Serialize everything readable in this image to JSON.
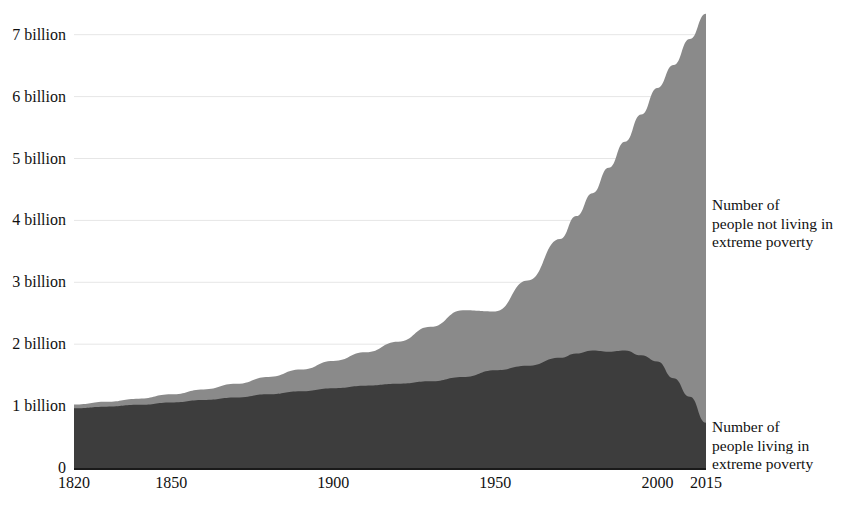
{
  "figure": {
    "background_color": "#ffffff"
  },
  "axes": {
    "y_ticks": [
      {
        "label": "0",
        "value": 0
      },
      {
        "label": "1 billion",
        "value": 1
      },
      {
        "label": "2 billion",
        "value": 2
      },
      {
        "label": "3 billion",
        "value": 3
      },
      {
        "label": "4 billion",
        "value": 4
      },
      {
        "label": "5 billion",
        "value": 5
      },
      {
        "label": "6 billion",
        "value": 6
      },
      {
        "label": "7 billion",
        "value": 7
      }
    ],
    "x_ticks": [
      {
        "label": "1820",
        "value": 1820
      },
      {
        "label": "1850",
        "value": 1850
      },
      {
        "label": "1900",
        "value": 1900
      },
      {
        "label": "1950",
        "value": 1950
      },
      {
        "label": "2000",
        "value": 2000
      },
      {
        "label": "2015",
        "value": 2015
      }
    ]
  },
  "annotations": {
    "not_in_poverty": "Number of\npeople not living in\nextreme poverty",
    "in_poverty": "Number of\npeople living in\nextreme poverty"
  },
  "colors": {
    "not_in_poverty_fill": "#8a8a8a",
    "in_poverty_fill": "#3d3d3d",
    "gridline": "#e6e6e6",
    "baseline": "#1a1a1a",
    "text": "#111111"
  },
  "chart_data": {
    "type": "area",
    "stacked": true,
    "title": "",
    "subtitle": "",
    "xlabel": "",
    "ylabel": "",
    "xlim": [
      1820,
      2015
    ],
    "ylim": [
      0,
      7.6
    ],
    "grid": true,
    "legend_position": "right-inline-annotations",
    "unit": "billion people",
    "x": [
      1820,
      1830,
      1840,
      1850,
      1860,
      1870,
      1880,
      1890,
      1900,
      1910,
      1920,
      1930,
      1940,
      1950,
      1960,
      1970,
      1975,
      1980,
      1985,
      1990,
      1995,
      2000,
      2005,
      2010,
      2015
    ],
    "series": [
      {
        "name": "Number of people living in extreme poverty",
        "color": "#3d3d3d",
        "values": [
          0.965,
          0.99,
          1.02,
          1.06,
          1.1,
          1.14,
          1.19,
          1.24,
          1.29,
          1.33,
          1.36,
          1.4,
          1.47,
          1.58,
          1.65,
          1.78,
          1.85,
          1.9,
          1.88,
          1.9,
          1.82,
          1.72,
          1.45,
          1.15,
          0.73
        ]
      },
      {
        "name": "Number of people not living in extreme poverty",
        "color": "#8a8a8a",
        "values": [
          0.06,
          0.08,
          0.1,
          0.13,
          0.17,
          0.22,
          0.28,
          0.35,
          0.44,
          0.54,
          0.68,
          0.88,
          1.08,
          0.95,
          1.38,
          1.92,
          2.22,
          2.54,
          2.97,
          3.37,
          3.89,
          4.42,
          5.06,
          5.78,
          6.61
        ]
      }
    ],
    "total_population": [
      1.025,
      1.07,
      1.12,
      1.19,
      1.27,
      1.36,
      1.47,
      1.59,
      1.73,
      1.87,
      2.04,
      2.28,
      2.55,
      2.53,
      3.03,
      3.7,
      4.07,
      4.44,
      4.85,
      5.27,
      5.71,
      6.14,
      6.51,
      6.93,
      7.34
    ]
  }
}
